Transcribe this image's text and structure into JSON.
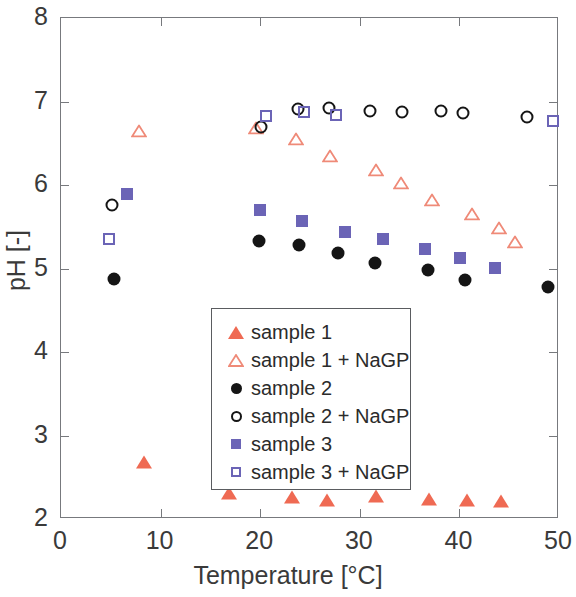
{
  "chart_data": {
    "type": "scatter",
    "title": "",
    "xlabel": "Temperature [°C]",
    "ylabel": "pH [-]",
    "xlim": [
      0,
      50
    ],
    "ylim": [
      2,
      8
    ],
    "xticks": [
      0,
      10,
      20,
      30,
      40,
      50
    ],
    "yticks": [
      2,
      3,
      4,
      5,
      6,
      7,
      8
    ],
    "xtick_labels": [
      "0",
      "10",
      "20",
      "30",
      "40",
      "50"
    ],
    "ytick_labels": [
      "2",
      "3",
      "4",
      "5",
      "6",
      "7",
      "8"
    ],
    "grid": false,
    "legend_position": "center-right",
    "series": [
      {
        "name": "sample 1",
        "marker": "triangle-filled",
        "color": "#ef6a53",
        "points": [
          [
            8.3,
            2.68
          ],
          [
            16.9,
            2.31
          ],
          [
            23.2,
            2.26
          ],
          [
            26.7,
            2.23
          ],
          [
            31.6,
            2.28
          ],
          [
            36.9,
            2.24
          ],
          [
            40.8,
            2.23
          ],
          [
            44.2,
            2.21
          ]
        ]
      },
      {
        "name": "sample 1 + NaGP",
        "marker": "triangle-open",
        "color": "#ef8a78",
        "points": [
          [
            7.8,
            6.65
          ],
          [
            19.6,
            6.84
          ],
          [
            23.6,
            6.86
          ],
          [
            27.0,
            6.82
          ],
          [
            31.6,
            6.8
          ],
          [
            34.1,
            6.8
          ],
          [
            37.2,
            6.76
          ],
          [
            41.3,
            6.74
          ],
          [
            44.0,
            6.73
          ],
          [
            45.6,
            6.72
          ]
        ]
      },
      {
        "name": "sample 2",
        "marker": "circle-filled",
        "color": "#151515",
        "points": [
          [
            5.3,
            4.88
          ],
          [
            19.9,
            5.33
          ],
          [
            23.9,
            5.28
          ],
          [
            27.8,
            5.19
          ],
          [
            31.5,
            5.07
          ],
          [
            36.8,
            4.98
          ],
          [
            40.6,
            4.86
          ],
          [
            48.9,
            4.78
          ]
        ]
      },
      {
        "name": "sample 2 + NaGP",
        "marker": "circle-open",
        "color": "#151515",
        "points": [
          [
            5.1,
            5.76
          ],
          [
            20.1,
            6.7
          ],
          [
            23.8,
            6.91
          ],
          [
            26.9,
            6.92
          ],
          [
            31.0,
            6.89
          ],
          [
            34.2,
            6.88
          ],
          [
            38.2,
            6.89
          ],
          [
            40.4,
            6.86
          ],
          [
            46.8,
            6.82
          ]
        ]
      },
      {
        "name": "sample 3",
        "marker": "square-filled",
        "color": "#6b64b6",
        "points": [
          [
            6.6,
            5.89
          ],
          [
            20.0,
            5.7
          ],
          [
            24.2,
            5.57
          ],
          [
            28.5,
            5.44
          ],
          [
            32.3,
            5.35
          ],
          [
            36.5,
            5.23
          ],
          [
            40.1,
            5.13
          ],
          [
            43.6,
            5.01
          ]
        ]
      },
      {
        "name": "sample 3 + NaGP",
        "marker": "square-open",
        "color": "#6b64b6",
        "points": [
          [
            4.8,
            5.35
          ],
          [
            20.6,
            6.83
          ],
          [
            24.4,
            6.87
          ],
          [
            27.6,
            6.84
          ],
          [
            49.4,
            6.77
          ]
        ]
      }
    ]
  },
  "legend": {
    "entries": [
      {
        "label": "sample 1",
        "marker": "triangle-filled",
        "color": "#ef6a53"
      },
      {
        "label": "sample 1 + NaGP",
        "marker": "triangle-open",
        "color": "#ef8a78"
      },
      {
        "label": "sample 2",
        "marker": "circle-filled",
        "color": "#151515"
      },
      {
        "label": "sample 2 + NaGP",
        "marker": "circle-open",
        "color": "#151515"
      },
      {
        "label": "sample 3",
        "marker": "square-filled",
        "color": "#6b64b6"
      },
      {
        "label": "sample 3 + NaGP",
        "marker": "square-open",
        "color": "#6b64b6"
      }
    ]
  }
}
